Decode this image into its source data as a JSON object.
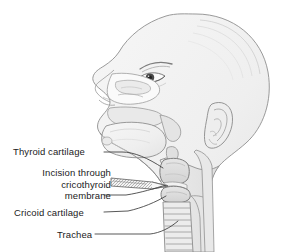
{
  "figure": {
    "caption_partial": ""
  },
  "colors": {
    "background": "#ffffff",
    "skin_fill": "#f0f0f0",
    "skin_fill_dark": "#e2e2e2",
    "cartilage_fill": "#dcdcdc",
    "cavity_fill": "#ffffff",
    "outline": "#8f8f8f",
    "outline_dark": "#6a6a6a",
    "label_text": "#1b1b1b",
    "leader_line": "#3a3a3a",
    "blade_fill": "#f4f4f4",
    "pupil": "#2a2a2a"
  },
  "labels": [
    {
      "id": "thyroid-cartilage",
      "text": "Thyroid cartilage",
      "lines": [
        "Thyroid cartilage"
      ]
    },
    {
      "id": "incision",
      "text": "Incision through cricothyroid membrane",
      "lines": [
        "Incision through",
        "cricothyroid",
        "membrane"
      ]
    },
    {
      "id": "cricoid-cartilage",
      "text": "Cricoid cartilage",
      "lines": [
        "Cricoid cartilage"
      ]
    },
    {
      "id": "trachea",
      "text": "Trachea",
      "lines": [
        "Trachea"
      ]
    }
  ],
  "anatomy": [
    "head-profile",
    "eye",
    "eyebrow",
    "nose",
    "nasal-cavity",
    "hard-palate",
    "soft-palate",
    "tongue",
    "mandible",
    "ear",
    "epiglottis",
    "larynx",
    "thyroid-cartilage",
    "cricoid-cartilage",
    "cricothyroid-membrane",
    "trachea",
    "esophagus",
    "cervical-vertebrae",
    "scalpel-blade"
  ]
}
